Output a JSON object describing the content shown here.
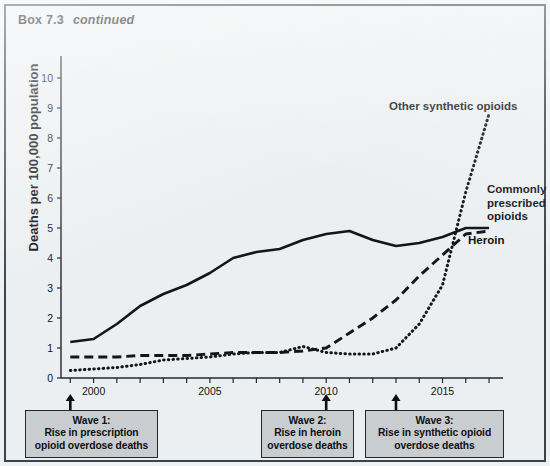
{
  "header": {
    "box_number": "Box 7.3",
    "continued": "continued"
  },
  "chart_data": {
    "type": "line",
    "title": "",
    "xlabel": "",
    "ylabel": "Deaths per 100,000 population",
    "xlim": [
      1998.6,
      2017.6
    ],
    "ylim": [
      0,
      10.6
    ],
    "yticks": [
      0,
      1,
      2,
      3,
      4,
      5,
      6,
      7,
      8,
      9,
      10
    ],
    "ytick_labels": [
      "0",
      "1",
      "2",
      "3",
      "4",
      "5",
      "6",
      "7",
      "8",
      "9",
      "10"
    ],
    "xticks": [
      1999,
      2000,
      2001,
      2002,
      2003,
      2004,
      2005,
      2006,
      2007,
      2008,
      2009,
      2010,
      2011,
      2012,
      2013,
      2014,
      2015,
      2016,
      2017
    ],
    "xtick_labels": [
      {
        "x": 2000,
        "label": "2000"
      },
      {
        "x": 2005,
        "label": "2005"
      },
      {
        "x": 2010,
        "label": "2010"
      },
      {
        "x": 2015,
        "label": "2015"
      }
    ],
    "grid": false,
    "legend": "inline-annotations",
    "x": [
      1999,
      2000,
      2001,
      2002,
      2003,
      2004,
      2005,
      2006,
      2007,
      2008,
      2009,
      2010,
      2011,
      2012,
      2013,
      2014,
      2015,
      2016,
      2017
    ],
    "series": [
      {
        "name": "Commonly prescribed opioids",
        "style": "solid",
        "color": "#121619",
        "values": [
          1.2,
          1.3,
          1.8,
          2.4,
          2.8,
          3.1,
          3.5,
          4.0,
          4.2,
          4.3,
          4.6,
          4.8,
          4.9,
          4.6,
          4.4,
          4.5,
          4.7,
          5.0,
          5.0
        ]
      },
      {
        "name": "Heroin",
        "style": "dashed",
        "color": "#121619",
        "values": [
          0.7,
          0.7,
          0.7,
          0.75,
          0.75,
          0.75,
          0.8,
          0.85,
          0.85,
          0.85,
          0.9,
          1.0,
          1.5,
          2.0,
          2.6,
          3.4,
          4.1,
          4.8,
          4.9
        ]
      },
      {
        "name": "Other synthetic opioids",
        "style": "dotted",
        "color": "#121619",
        "values": [
          0.25,
          0.3,
          0.35,
          0.45,
          0.6,
          0.65,
          0.7,
          0.8,
          0.85,
          0.85,
          1.05,
          0.85,
          0.8,
          0.8,
          1.0,
          1.8,
          3.1,
          6.2,
          8.8
        ]
      }
    ],
    "annotations": [
      {
        "name": "other-synthetic-opioids",
        "text": "Other synthetic opioids"
      },
      {
        "name": "commonly-prescribed-opioids",
        "text": "Commonly\nprescribed\nopioids"
      },
      {
        "name": "heroin",
        "text": "Heroin"
      }
    ],
    "markers": [
      {
        "name": "wave-1",
        "x": 1999,
        "title": "Wave 1:",
        "text": "Wave 1:\nRise in prescription\nopioid overdose deaths"
      },
      {
        "name": "wave-2",
        "x": 2010,
        "title": "Wave 2:",
        "text": "Wave 2:\nRise in heroin\noverdose deaths"
      },
      {
        "name": "wave-3",
        "x": 2013,
        "title": "Wave 3:",
        "text": "Wave 3:\nRise in synthetic opioid\noverdose deaths"
      }
    ]
  }
}
